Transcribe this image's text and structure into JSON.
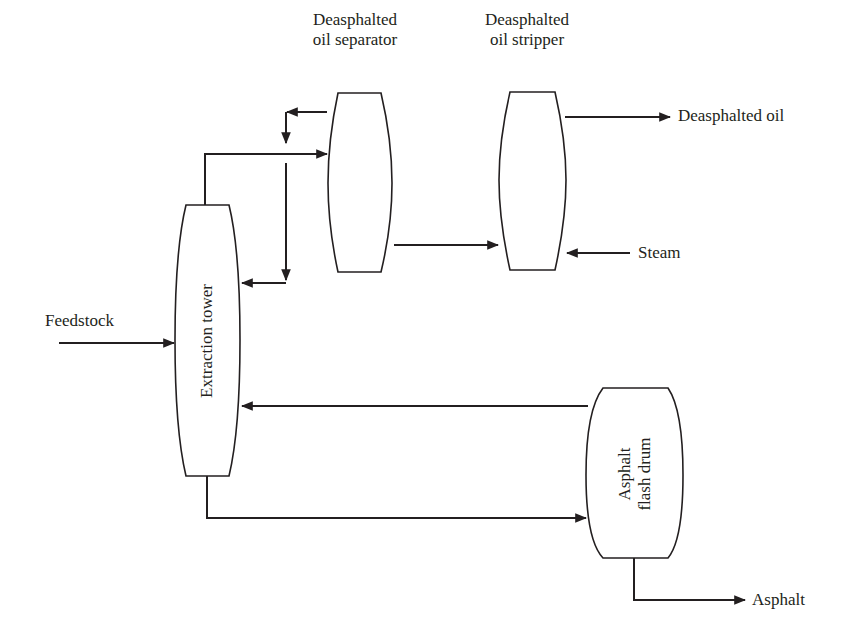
{
  "diagram": {
    "units": {
      "extraction_tower": {
        "label": "Extraction tower"
      },
      "separator": {
        "label_line1": "Deasphalted",
        "label_line2": "oil separator"
      },
      "stripper": {
        "label_line1": "Deasphalted",
        "label_line2": "oil stripper"
      },
      "flash_drum": {
        "label_line1": "Asphalt",
        "label_line2": "flash drum"
      }
    },
    "streams": {
      "feedstock": "Feedstock",
      "deasphalted_oil": "Deasphalted oil",
      "steam": "Steam",
      "asphalt": "Asphalt"
    },
    "colors": {
      "line": "#231f20",
      "background": "#ffffff"
    }
  }
}
